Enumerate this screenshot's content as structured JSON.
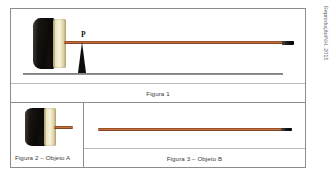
{
  "figure": {
    "credit": "Reprodução/NH, 2015",
    "panels": [
      {
        "id": "figura-1",
        "caption": "Figura 1",
        "description": "Vassoura em equilíbrio sobre um apoio",
        "point_label": "P"
      },
      {
        "id": "figura-2",
        "caption": "Figura 2 – Objeto A",
        "description": "Cabeça da vassoura com pedaço curto do cabo"
      },
      {
        "id": "figura-3",
        "caption": "Figura 3 – Objeto B",
        "description": "Cabo longo de madeira"
      }
    ]
  }
}
